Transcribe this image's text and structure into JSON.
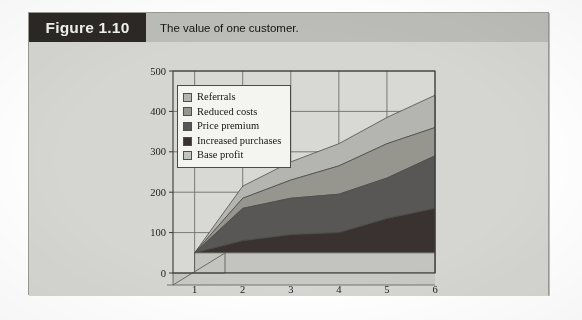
{
  "figure": {
    "number_label": "Figure 1.10",
    "caption": "The value of one customer."
  },
  "colors": {
    "page_background": "#ffffff",
    "box_background": "#d5d5d1",
    "box_border": "#9a9a96",
    "number_block": "#2b2825",
    "caption_band": "#bcbcb8",
    "plot_background": "#d8d8d4",
    "grid_line": "#6e6e6a",
    "axis_line": "#3a3a37",
    "legend_background": "#f4f4f1",
    "legend_border": "#4a4a47",
    "series_referrals": "#b4b4b0",
    "series_reduced_costs": "#96968f",
    "series_price_premium": "#595755",
    "series_increased_purchases": "#3a3231",
    "series_base_profit": "#c3c3bf"
  },
  "chart_data": {
    "type": "area",
    "stacked": true,
    "title": "The value of one customer.",
    "xlabel": "",
    "ylabel": "",
    "x": [
      1,
      2,
      3,
      4,
      5,
      6
    ],
    "xticklabels": [
      "1",
      "2",
      "3",
      "4",
      "5",
      "6"
    ],
    "yticklabels": [
      "0",
      "100",
      "200",
      "300",
      "400",
      "500"
    ],
    "yticks": [
      0,
      100,
      200,
      300,
      400,
      500
    ],
    "xlim": [
      0.55,
      6
    ],
    "ylim": [
      0,
      500
    ],
    "grid": true,
    "legend_position": "upper-left-inside",
    "origin_note": "all series converge to a single point at x=1",
    "series": [
      {
        "name": "Base profit",
        "order": 1,
        "color": "#c3c3bf",
        "values": [
          50,
          50,
          50,
          50,
          50,
          50
        ]
      },
      {
        "name": "Increased purchases",
        "order": 2,
        "color": "#3a3231",
        "cumulative": [
          50,
          80,
          95,
          100,
          135,
          160
        ],
        "values": [
          0,
          30,
          45,
          50,
          85,
          110
        ]
      },
      {
        "name": "Price premium",
        "order": 3,
        "color": "#595755",
        "cumulative": [
          50,
          160,
          185,
          195,
          235,
          290
        ],
        "values": [
          0,
          80,
          90,
          95,
          100,
          130
        ]
      },
      {
        "name": "Reduced costs",
        "order": 4,
        "color": "#96968f",
        "cumulative": [
          50,
          185,
          230,
          265,
          320,
          360
        ],
        "values": [
          0,
          25,
          45,
          70,
          85,
          70
        ]
      },
      {
        "name": "Referrals",
        "order": 5,
        "color": "#b4b4b0",
        "cumulative": [
          50,
          215,
          275,
          320,
          385,
          440
        ],
        "values": [
          0,
          30,
          45,
          55,
          65,
          80
        ]
      }
    ]
  },
  "legend": {
    "items": [
      {
        "label": "Referrals",
        "swatch": "#b4b4b0"
      },
      {
        "label": "Reduced costs",
        "swatch": "#96968f"
      },
      {
        "label": "Price premium",
        "swatch": "#595755"
      },
      {
        "label": "Increased purchases",
        "swatch": "#3a3231"
      },
      {
        "label": "Base profit",
        "swatch": "#c3c3bf"
      }
    ]
  },
  "axes": {
    "y_labels": [
      "500",
      "400",
      "300",
      "200",
      "100",
      "0"
    ],
    "x_labels": [
      "1",
      "2",
      "3",
      "4",
      "5",
      "6"
    ]
  }
}
